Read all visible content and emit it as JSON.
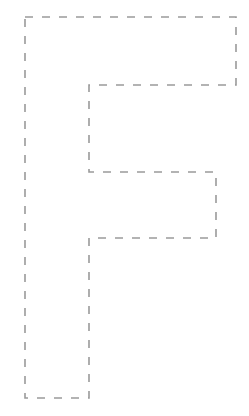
{
  "figure": {
    "shape": "letter-F-outline",
    "stroke_color": "#9a9a9a",
    "stroke_style": "dashed",
    "dash_pattern": "8 9",
    "background": "#ffffff",
    "vertices": [
      [
        25,
        17
      ],
      [
        236,
        17
      ],
      [
        236,
        85
      ],
      [
        89,
        85
      ],
      [
        89,
        172
      ],
      [
        216,
        172
      ],
      [
        216,
        238
      ],
      [
        89,
        238
      ],
      [
        89,
        398
      ],
      [
        25,
        398
      ]
    ]
  }
}
